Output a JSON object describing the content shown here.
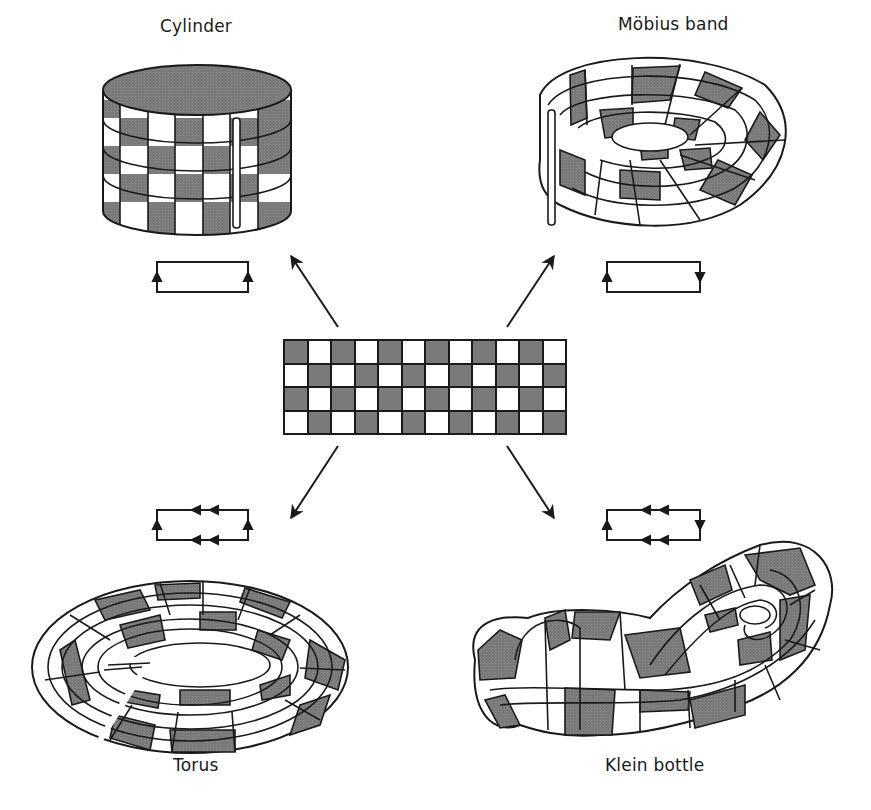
{
  "figure": {
    "colors": {
      "dark": "#7a7a7a",
      "light": "#ffffff",
      "line": "#1a1a1a"
    },
    "source_sheet": {
      "rows": 4,
      "cols": 12,
      "top_left": "dark"
    },
    "surfaces": [
      {
        "id": "cylinder",
        "label": "Cylinder",
        "left_edge": "up",
        "right_edge": "up",
        "top_bottom_edges": "none"
      },
      {
        "id": "mobius-band",
        "label": "Möbius band",
        "left_edge": "up",
        "right_edge": "down",
        "top_bottom_edges": "none"
      },
      {
        "id": "torus",
        "label": "Torus",
        "left_edge": "up",
        "right_edge": "up",
        "top_bottom_edges": "double-arrow-left"
      },
      {
        "id": "klein-bottle",
        "label": "Klein bottle",
        "left_edge": "up",
        "right_edge": "down",
        "top_bottom_edges": "double-arrow-left"
      }
    ]
  }
}
